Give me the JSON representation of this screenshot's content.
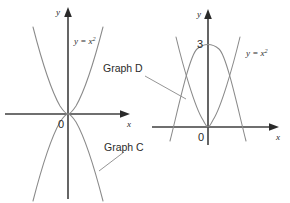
{
  "figure": {
    "background_color": "#ffffff",
    "axis_color": "#3f3f3f",
    "curve_color": "#8a8a8a",
    "text_color": "#2b2b2b",
    "panels": [
      {
        "id": "left",
        "name": "graph-c-panel",
        "axes": {
          "x_label": "x",
          "y_label": "y",
          "origin_label": "0"
        },
        "curves": [
          {
            "name": "parabola-up",
            "label": "y = x",
            "label_exponent": "2",
            "equation": "y = x^2",
            "direction": "up",
            "vertex": [
              0,
              0
            ]
          },
          {
            "name": "graph-c-curve",
            "label": "Graph C",
            "equation": "y = -x^2",
            "direction": "down",
            "vertex": [
              0,
              0
            ]
          }
        ],
        "callout": "Graph C"
      },
      {
        "id": "right",
        "name": "graph-d-panel",
        "axes": {
          "x_label": "x",
          "y_label": "y",
          "origin_label": "0",
          "y_tick_label": "3"
        },
        "curves": [
          {
            "name": "parabola-up",
            "label": "y = x",
            "label_exponent": "2",
            "equation": "y = x^2",
            "direction": "up",
            "vertex": [
              0,
              0
            ]
          },
          {
            "name": "graph-d-curve",
            "label": "Graph D",
            "equation": "y = 3 - x^2",
            "direction": "down",
            "vertex": [
              0,
              3
            ]
          }
        ],
        "callout": "Graph D"
      }
    ]
  }
}
